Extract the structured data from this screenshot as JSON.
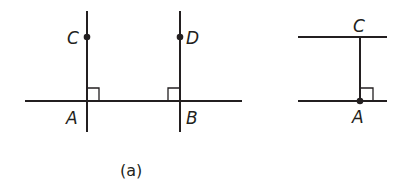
{
  "figure_a": {
    "caption": "(a)",
    "points": {
      "A": "A",
      "B": "B",
      "C": "C",
      "D": "D"
    },
    "description": "Line through A and B with perpendiculars AC and BD marked with right angles"
  },
  "figure_b": {
    "points": {
      "A": "A",
      "C": "C"
    },
    "description": "Two parallel lines with perpendicular segment CA marked with right angle at A"
  },
  "colors": {
    "stroke": "#231f20",
    "background": "#ffffff"
  }
}
